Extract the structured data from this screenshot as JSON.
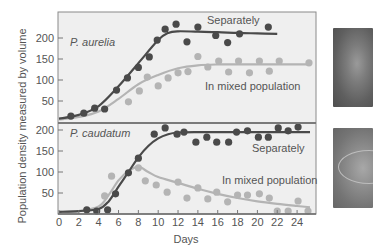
{
  "chart_data": [
    {
      "type": "scatter",
      "panel": "top",
      "title": "P. aurelia",
      "xlabel": "Days",
      "ylabel": "Population density measured by volume",
      "xlim": [
        0,
        26
      ],
      "ylim": [
        0,
        250
      ],
      "x_ticks": [
        0,
        2,
        4,
        6,
        8,
        10,
        12,
        14,
        16,
        18,
        20,
        22,
        24
      ],
      "y_ticks": [
        50,
        100,
        150,
        200
      ],
      "series": [
        {
          "name": "Separately",
          "color": "#4a4a4a",
          "points": [
            [
              1.2,
              14
            ],
            [
              2.5,
              21
            ],
            [
              3.6,
              33
            ],
            [
              4.6,
              31
            ],
            [
              5.8,
              76
            ],
            [
              6.9,
              105
            ],
            [
              8.0,
              130
            ],
            [
              9.1,
              155
            ],
            [
              9.9,
              195
            ],
            [
              10.7,
              221
            ],
            [
              11.8,
              233
            ],
            [
              12.9,
              191
            ],
            [
              14.0,
              226
            ],
            [
              15.8,
              206
            ],
            [
              17.0,
              189
            ],
            [
              18.2,
              210
            ],
            [
              21.1,
              226
            ]
          ],
          "curve": [
            [
              0,
              8
            ],
            [
              2,
              17
            ],
            [
              4,
              38
            ],
            [
              6,
              85
            ],
            [
              8,
              140
            ],
            [
              10,
              195
            ],
            [
              11,
              212
            ],
            [
              12,
              216
            ],
            [
              14,
              215
            ],
            [
              16,
              214
            ],
            [
              18,
              212
            ],
            [
              20,
              211
            ],
            [
              22,
              210
            ]
          ]
        },
        {
          "name": "In mixed population",
          "color": "#b4b4b4",
          "points": [
            [
              7.0,
              48
            ],
            [
              8.1,
              74
            ],
            [
              8.9,
              107
            ],
            [
              10.0,
              86
            ],
            [
              11.0,
              105
            ],
            [
              12.0,
              117
            ],
            [
              13.0,
              120
            ],
            [
              14.0,
              156
            ],
            [
              15.0,
              131
            ],
            [
              16.1,
              145
            ],
            [
              17.1,
              119
            ],
            [
              18.1,
              145
            ],
            [
              19.2,
              117
            ],
            [
              20.2,
              145
            ],
            [
              21.2,
              121
            ],
            [
              22.2,
              145
            ],
            [
              25.2,
              141
            ]
          ],
          "curve": [
            [
              0,
              6
            ],
            [
              2,
              12
            ],
            [
              4,
              25
            ],
            [
              6,
              55
            ],
            [
              8,
              90
            ],
            [
              10,
              112
            ],
            [
              12,
              128
            ],
            [
              14,
              135
            ],
            [
              16,
              137
            ],
            [
              18,
              137
            ],
            [
              20,
              137
            ],
            [
              22,
              137
            ],
            [
              24,
              137
            ],
            [
              25.3,
              137
            ]
          ]
        }
      ],
      "annotations": [
        "Separately",
        "In mixed population"
      ]
    },
    {
      "type": "scatter",
      "panel": "bottom",
      "title": "P. caudatum",
      "xlabel": "Days",
      "ylabel": "Population density measured by volume",
      "xlim": [
        0,
        26
      ],
      "ylim": [
        0,
        210
      ],
      "x_ticks": [
        0,
        2,
        4,
        6,
        8,
        10,
        12,
        14,
        16,
        18,
        20,
        22,
        24
      ],
      "y_ticks": [
        50,
        100,
        150,
        200
      ],
      "series": [
        {
          "name": "Separately",
          "color": "#4a4a4a",
          "points": [
            [
              2.8,
              10
            ],
            [
              3.8,
              7
            ],
            [
              4.9,
              10
            ],
            [
              5.7,
              48
            ],
            [
              7.0,
              98
            ],
            [
              8.0,
              133
            ],
            [
              9.6,
              190
            ],
            [
              10.7,
              205
            ],
            [
              11.9,
              190
            ],
            [
              12.6,
              195
            ],
            [
              13.8,
              171
            ],
            [
              14.9,
              183
            ],
            [
              15.9,
              171
            ],
            [
              17.1,
              171
            ],
            [
              17.9,
              195
            ],
            [
              19.0,
              198
            ],
            [
              20.1,
              183
            ],
            [
              21.1,
              183
            ],
            [
              22.1,
              205
            ],
            [
              23.1,
              198
            ],
            [
              24.1,
              207
            ]
          ],
          "curve": [
            [
              0,
              5
            ],
            [
              2,
              7
            ],
            [
              4,
              12
            ],
            [
              5,
              30
            ],
            [
              6,
              65
            ],
            [
              7,
              100
            ],
            [
              8,
              135
            ],
            [
              9,
              162
            ],
            [
              10,
              180
            ],
            [
              11,
              190
            ],
            [
              12,
              194
            ],
            [
              14,
              195
            ],
            [
              16,
              195
            ],
            [
              18,
              195
            ],
            [
              20,
              195
            ],
            [
              22,
              195
            ],
            [
              24,
              195
            ],
            [
              25.3,
              195
            ]
          ]
        },
        {
          "name": "In mixed population",
          "color": "#b4b4b4",
          "points": [
            [
              4.6,
              43
            ],
            [
              5.3,
              90
            ],
            [
              8.0,
              110
            ],
            [
              8.7,
              79
            ],
            [
              9.8,
              69
            ],
            [
              10.9,
              52
            ],
            [
              12.0,
              76
            ],
            [
              12.9,
              38
            ],
            [
              14.0,
              62
            ],
            [
              15.0,
              36
            ],
            [
              15.9,
              52
            ],
            [
              17.0,
              29
            ],
            [
              18.0,
              45
            ],
            [
              19.0,
              45
            ],
            [
              20.2,
              48
            ],
            [
              21.2,
              38
            ],
            [
              22.0,
              7
            ],
            [
              23.1,
              7
            ],
            [
              24.1,
              31
            ],
            [
              25.1,
              7
            ]
          ],
          "curve": [
            [
              0,
              5
            ],
            [
              2,
              7
            ],
            [
              4,
              18
            ],
            [
              5,
              45
            ],
            [
              6,
              80
            ],
            [
              7,
              102
            ],
            [
              8,
              112
            ],
            [
              9,
              100
            ],
            [
              10,
              88
            ],
            [
              12,
              74
            ],
            [
              14,
              60
            ],
            [
              16,
              48
            ],
            [
              18,
              38
            ],
            [
              20,
              30
            ],
            [
              22,
              24
            ],
            [
              24,
              19
            ],
            [
              25.3,
              16
            ]
          ]
        }
      ],
      "annotations": [
        "Separately",
        "In mixed population"
      ]
    }
  ],
  "labels": {
    "ylabel": "Population density measured by volume",
    "xlabel": "Days",
    "top_panel": "P. aurelia",
    "bottom_panel": "P. caudatum",
    "top_separately": "Separately",
    "top_mixed": "In mixed population",
    "bottom_separately": "Separately",
    "bottom_mixed": "In mixed population"
  },
  "images": {
    "top": "P. aurelia micrograph",
    "bottom": "P. caudatum micrograph"
  }
}
